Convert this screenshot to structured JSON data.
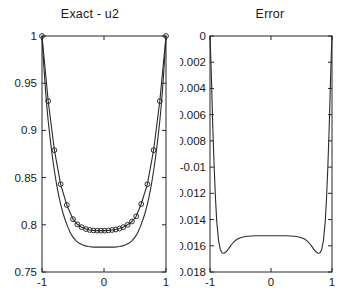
{
  "figure": {
    "background_color": "#ffffff",
    "line_color": "#2b2b2b",
    "axis_color": "#262626",
    "width": 360,
    "height": 306
  },
  "panels": [
    {
      "id": "exact-u2",
      "title": "Exact - u2",
      "xlabel": "",
      "ylabel": ""
    },
    {
      "id": "error",
      "title": "Error",
      "xlabel": "",
      "ylabel": ""
    }
  ],
  "chart_data": [
    {
      "type": "line",
      "title": "Exact - u2",
      "xlabel": "",
      "ylabel": "",
      "xlim": [
        -1,
        1
      ],
      "ylim": [
        0.75,
        1
      ],
      "xticks": [
        -1,
        0,
        1
      ],
      "xtick_labels": [
        "-1",
        "0",
        "1"
      ],
      "yticks": [
        0.75,
        0.8,
        0.85,
        0.9,
        0.95,
        1
      ],
      "ytick_labels": [
        "0.75",
        "0.8",
        "0.85",
        "0.9",
        "0.95",
        "1"
      ],
      "grid": false,
      "legend": "none",
      "series": [
        {
          "name": "Exact",
          "style": "solid-line",
          "marker": "none",
          "x": [
            -1.0,
            -0.98,
            -0.96,
            -0.94,
            -0.92,
            -0.9,
            -0.88,
            -0.85,
            -0.82,
            -0.79,
            -0.76,
            -0.73,
            -0.7,
            -0.66,
            -0.62,
            -0.58,
            -0.54,
            -0.5,
            -0.45,
            -0.4,
            -0.35,
            -0.3,
            -0.25,
            -0.2,
            -0.15,
            -0.1,
            -0.05,
            0.0,
            0.05,
            0.1,
            0.15,
            0.2,
            0.25,
            0.3,
            0.35,
            0.4,
            0.45,
            0.5,
            0.54,
            0.58,
            0.62,
            0.66,
            0.7,
            0.73,
            0.76,
            0.79,
            0.82,
            0.85,
            0.88,
            0.9,
            0.92,
            0.94,
            0.96,
            0.98,
            1.0
          ],
          "y": [
            1.0,
            0.978,
            0.958,
            0.94,
            0.924,
            0.91,
            0.898,
            0.881,
            0.866,
            0.853,
            0.841,
            0.831,
            0.822,
            0.812,
            0.804,
            0.797,
            0.791,
            0.787,
            0.783,
            0.7805,
            0.7788,
            0.7777,
            0.777,
            0.7766,
            0.7764,
            0.7763,
            0.7763,
            0.7763,
            0.7763,
            0.7763,
            0.7764,
            0.7766,
            0.777,
            0.7777,
            0.7788,
            0.7805,
            0.783,
            0.787,
            0.791,
            0.797,
            0.804,
            0.812,
            0.822,
            0.831,
            0.841,
            0.853,
            0.866,
            0.881,
            0.898,
            0.91,
            0.924,
            0.94,
            0.958,
            0.978,
            1.0
          ]
        },
        {
          "name": "u2 (numerical)",
          "style": "line-with-circle-markers",
          "marker": "circle-open",
          "x": [
            -1.0,
            -0.9,
            -0.8,
            -0.7,
            -0.6,
            -0.5,
            -0.43,
            -0.36,
            -0.29,
            -0.23,
            -0.17,
            -0.11,
            -0.05,
            0.01,
            0.07,
            0.13,
            0.19,
            0.25,
            0.31,
            0.38,
            0.45,
            0.52,
            0.6,
            0.7,
            0.8,
            0.9,
            1.0
          ],
          "y": [
            1.0,
            0.931,
            0.879,
            0.843,
            0.821,
            0.806,
            0.8005,
            0.7975,
            0.7955,
            0.7945,
            0.794,
            0.7938,
            0.7938,
            0.7938,
            0.794,
            0.7945,
            0.795,
            0.796,
            0.7975,
            0.8,
            0.8035,
            0.809,
            0.822,
            0.843,
            0.879,
            0.931,
            1.0
          ]
        }
      ]
    },
    {
      "type": "line",
      "title": "Error",
      "xlabel": "",
      "ylabel": "",
      "xlim": [
        -1,
        1
      ],
      "ylim": [
        -0.018,
        0
      ],
      "xticks": [
        -1,
        0,
        1
      ],
      "xtick_labels": [
        "-1",
        "0",
        "1"
      ],
      "yticks": [
        -0.018,
        -0.016,
        -0.014,
        -0.012,
        -0.01,
        -0.008,
        -0.006,
        -0.004,
        -0.002,
        0
      ],
      "ytick_labels": [
        "-0.018",
        "-0.016",
        "-0.014",
        "-0.012",
        "-0.01",
        "-0.008",
        "-0.006",
        "-0.004",
        "-0.002",
        "0"
      ],
      "grid": false,
      "legend": "none",
      "series": [
        {
          "name": "Error",
          "style": "solid-line",
          "marker": "none",
          "x": [
            -1.0,
            -0.99,
            -0.98,
            -0.97,
            -0.96,
            -0.95,
            -0.93,
            -0.91,
            -0.89,
            -0.86,
            -0.83,
            -0.8,
            -0.77,
            -0.74,
            -0.71,
            -0.68,
            -0.65,
            -0.6,
            -0.55,
            -0.5,
            -0.44,
            -0.38,
            -0.32,
            -0.26,
            -0.2,
            -0.13,
            -0.06,
            0.0,
            0.06,
            0.13,
            0.2,
            0.26,
            0.32,
            0.38,
            0.44,
            0.5,
            0.55,
            0.6,
            0.65,
            0.68,
            0.71,
            0.74,
            0.77,
            0.8,
            0.83,
            0.86,
            0.89,
            0.91,
            0.93,
            0.95,
            0.96,
            0.97,
            0.98,
            0.99,
            1.0
          ],
          "y": [
            0.0,
            -0.0012,
            -0.0027,
            -0.0043,
            -0.006,
            -0.0076,
            -0.0102,
            -0.0124,
            -0.0141,
            -0.0156,
            -0.0163,
            -0.01655,
            -0.01657,
            -0.01648,
            -0.01632,
            -0.01612,
            -0.01592,
            -0.01566,
            -0.01548,
            -0.01538,
            -0.01531,
            -0.01527,
            -0.01525,
            -0.01524,
            -0.015235,
            -0.015232,
            -0.01523,
            -0.01523,
            -0.01523,
            -0.015232,
            -0.015235,
            -0.01524,
            -0.01525,
            -0.01527,
            -0.01531,
            -0.01538,
            -0.01548,
            -0.01566,
            -0.01592,
            -0.01612,
            -0.01632,
            -0.01648,
            -0.01657,
            -0.01655,
            -0.0163,
            -0.0156,
            -0.0141,
            -0.0124,
            -0.0102,
            -0.0076,
            -0.006,
            -0.0043,
            -0.0027,
            -0.0012,
            0.0
          ]
        }
      ]
    }
  ]
}
